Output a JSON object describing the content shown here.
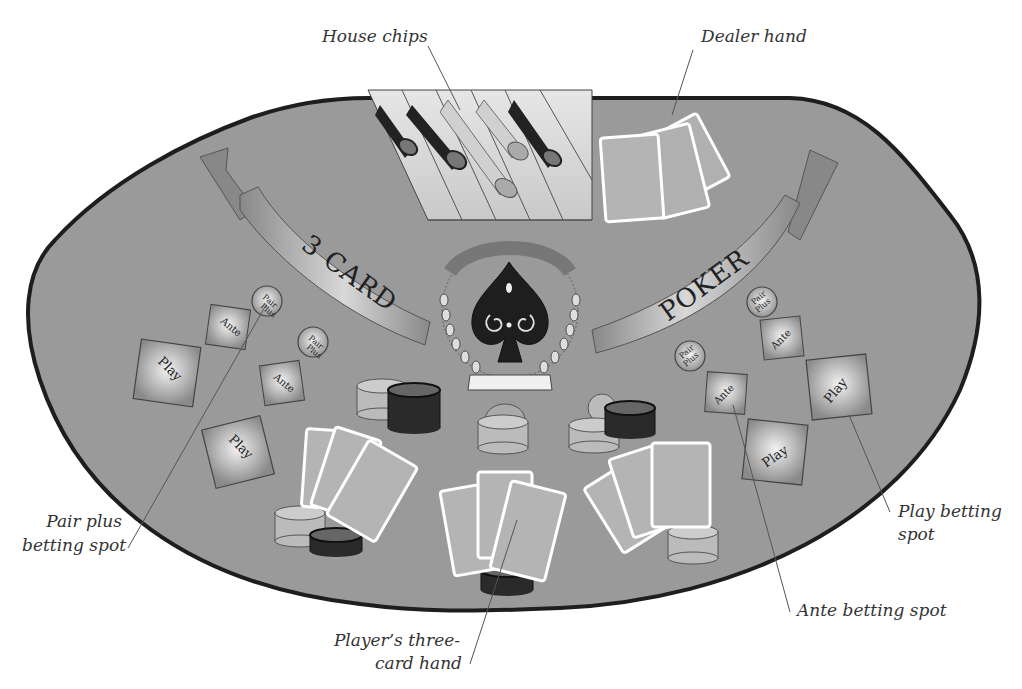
{
  "diagram": {
    "colors": {
      "felt": "#9a9a9a",
      "table_edge": "#222222",
      "card_face": "#b4b4b4",
      "card_border": "#ffffff",
      "chip_light": "#bdbdbd",
      "chip_dark": "#2a2a2a",
      "banner": "#8e8e8e",
      "background": "#ffffff"
    },
    "banner": {
      "left_text": "3 CARD",
      "right_text": "POKER"
    },
    "emblem": {
      "icon": "spade-icon"
    },
    "callouts": {
      "house_chips": "House chips",
      "dealer_hand": "Dealer hand",
      "pair_plus_1": "Pair plus",
      "pair_plus_2": "betting spot",
      "play_1": "Play betting",
      "play_2": "spot",
      "ante": "Ante betting spot",
      "player_hand_1": "Player’s three-",
      "player_hand_2": "card hand"
    },
    "spots": {
      "pair_plus_line1": "Pair",
      "pair_plus_line2": "Plus",
      "ante": "Ante",
      "play": "Play"
    }
  }
}
